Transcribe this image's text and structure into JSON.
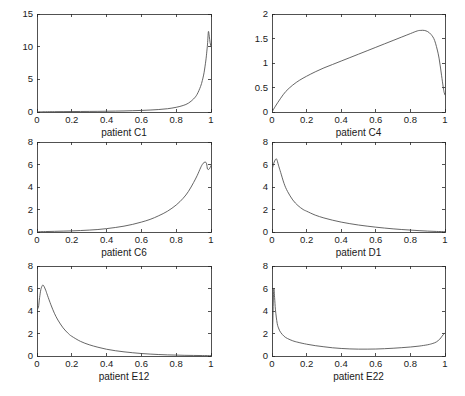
{
  "figure": {
    "background": "#ffffff",
    "curve_color": "#4a4a4a",
    "axis_color": "#262626",
    "rows": 3,
    "cols": 2
  },
  "chart_data": [
    {
      "type": "line",
      "title": "",
      "xlabel": "patient C1",
      "ylabel": "",
      "xlim": [
        0,
        1
      ],
      "ylim": [
        0,
        15
      ],
      "xticks": [
        0,
        0.2,
        0.4,
        0.6,
        0.8,
        1
      ],
      "yticks": [
        0,
        5,
        10,
        15
      ],
      "xticklabels": [
        "0",
        "0.2",
        "0.4",
        "0.6",
        "0.8",
        "1"
      ],
      "yticklabels": [
        "0",
        "5",
        "10",
        "15"
      ],
      "grid": false,
      "legend": "none",
      "x": [
        0,
        0.02,
        0.05,
        0.1,
        0.15,
        0.2,
        0.25,
        0.3,
        0.35,
        0.4,
        0.45,
        0.5,
        0.55,
        0.6,
        0.65,
        0.7,
        0.75,
        0.8,
        0.84,
        0.87,
        0.9,
        0.92,
        0.94,
        0.95,
        0.96,
        0.97,
        0.975,
        0.98,
        0.985,
        0.99,
        0.995,
        1
      ],
      "y": [
        0.02,
        0.03,
        0.04,
        0.05,
        0.06,
        0.07,
        0.08,
        0.09,
        0.1,
        0.12,
        0.14,
        0.16,
        0.2,
        0.24,
        0.3,
        0.38,
        0.5,
        0.72,
        1.0,
        1.35,
        2.0,
        2.7,
        3.9,
        4.8,
        6.0,
        7.8,
        9.0,
        10.4,
        12.3,
        11.6,
        10.6,
        10.0
      ]
    },
    {
      "type": "line",
      "title": "",
      "xlabel": "patient C4",
      "ylabel": "",
      "xlim": [
        0,
        1
      ],
      "ylim": [
        0,
        2
      ],
      "xticks": [
        0,
        0.2,
        0.4,
        0.6,
        0.8,
        1
      ],
      "yticks": [
        0,
        0.5,
        1,
        1.5,
        2
      ],
      "xticklabels": [
        "0",
        "0.2",
        "0.4",
        "0.6",
        "0.8",
        "1"
      ],
      "yticklabels": [
        "0",
        "0.5",
        "1",
        "1.5",
        "2"
      ],
      "grid": false,
      "legend": "none",
      "x": [
        0,
        0.02,
        0.05,
        0.08,
        0.12,
        0.16,
        0.2,
        0.25,
        0.3,
        0.35,
        0.4,
        0.45,
        0.5,
        0.55,
        0.6,
        0.65,
        0.7,
        0.75,
        0.8,
        0.84,
        0.86,
        0.88,
        0.9,
        0.92,
        0.94,
        0.96,
        0.97,
        0.98,
        0.99,
        0.995,
        1
      ],
      "y": [
        0.0,
        0.12,
        0.28,
        0.42,
        0.55,
        0.65,
        0.73,
        0.82,
        0.9,
        0.97,
        1.04,
        1.11,
        1.18,
        1.25,
        1.32,
        1.39,
        1.46,
        1.53,
        1.6,
        1.655,
        1.665,
        1.665,
        1.64,
        1.58,
        1.46,
        1.2,
        1.0,
        0.75,
        0.5,
        0.4,
        0.35
      ]
    },
    {
      "type": "line",
      "title": "",
      "xlabel": "patient C6",
      "ylabel": "",
      "xlim": [
        0,
        1
      ],
      "ylim": [
        0,
        8
      ],
      "xticks": [
        0,
        0.2,
        0.4,
        0.6,
        0.8,
        1
      ],
      "yticks": [
        0,
        2,
        4,
        6,
        8
      ],
      "xticklabels": [
        "0",
        "0.2",
        "0.4",
        "0.6",
        "0.8",
        "1"
      ],
      "yticklabels": [
        "0",
        "2",
        "4",
        "6",
        "8"
      ],
      "grid": false,
      "legend": "none",
      "x": [
        0,
        0.05,
        0.1,
        0.15,
        0.2,
        0.25,
        0.3,
        0.35,
        0.4,
        0.45,
        0.5,
        0.55,
        0.6,
        0.65,
        0.7,
        0.75,
        0.8,
        0.84,
        0.87,
        0.9,
        0.92,
        0.94,
        0.95,
        0.96,
        0.97,
        0.975,
        0.98,
        0.99,
        1
      ],
      "y": [
        0.02,
        0.04,
        0.06,
        0.08,
        0.1,
        0.13,
        0.17,
        0.22,
        0.3,
        0.4,
        0.52,
        0.68,
        0.88,
        1.12,
        1.45,
        1.85,
        2.4,
        3.0,
        3.6,
        4.4,
        5.0,
        5.7,
        6.0,
        6.18,
        6.2,
        6.05,
        5.6,
        5.6,
        5.9
      ]
    },
    {
      "type": "line",
      "title": "",
      "xlabel": "patient D1",
      "ylabel": "",
      "xlim": [
        0,
        1
      ],
      "ylim": [
        0,
        8
      ],
      "xticks": [
        0,
        0.2,
        0.4,
        0.6,
        0.8,
        1
      ],
      "yticks": [
        0,
        2,
        4,
        6,
        8
      ],
      "xticklabels": [
        "0",
        "0.2",
        "0.4",
        "0.6",
        "0.8",
        "1"
      ],
      "yticklabels": [
        "0",
        "2",
        "4",
        "6",
        "8"
      ],
      "grid": false,
      "legend": "none",
      "x": [
        0,
        0.01,
        0.02,
        0.025,
        0.03,
        0.04,
        0.05,
        0.07,
        0.09,
        0.12,
        0.15,
        0.18,
        0.2,
        0.25,
        0.3,
        0.35,
        0.4,
        0.45,
        0.5,
        0.55,
        0.6,
        0.65,
        0.7,
        0.75,
        0.8,
        0.85,
        0.9,
        0.95,
        1
      ],
      "y": [
        5.5,
        6.1,
        6.45,
        6.5,
        6.35,
        5.8,
        5.3,
        4.3,
        3.6,
        2.85,
        2.35,
        2.0,
        1.85,
        1.5,
        1.25,
        1.05,
        0.88,
        0.74,
        0.62,
        0.52,
        0.43,
        0.35,
        0.28,
        0.22,
        0.17,
        0.12,
        0.08,
        0.05,
        0.03
      ]
    },
    {
      "type": "line",
      "title": "",
      "xlabel": "patient E12",
      "ylabel": "",
      "xlim": [
        0,
        1
      ],
      "ylim": [
        0,
        8
      ],
      "xticks": [
        0,
        0.2,
        0.4,
        0.6,
        0.8,
        1
      ],
      "yticks": [
        0,
        2,
        4,
        6,
        8
      ],
      "xticklabels": [
        "0",
        "0.2",
        "0.4",
        "0.6",
        "0.8",
        "1"
      ],
      "yticklabels": [
        "0",
        "2",
        "4",
        "6",
        "8"
      ],
      "grid": false,
      "legend": "none",
      "x": [
        0,
        0.008,
        0.015,
        0.022,
        0.03,
        0.035,
        0.04,
        0.05,
        0.06,
        0.08,
        0.1,
        0.12,
        0.15,
        0.18,
        0.2,
        0.25,
        0.3,
        0.35,
        0.4,
        0.45,
        0.5,
        0.55,
        0.6,
        0.65,
        0.7,
        0.75,
        0.8,
        0.85,
        0.9,
        0.95,
        1
      ],
      "y": [
        4.2,
        4.3,
        5.2,
        5.9,
        6.25,
        6.3,
        6.2,
        5.85,
        5.4,
        4.55,
        3.8,
        3.2,
        2.5,
        2.0,
        1.75,
        1.3,
        1.0,
        0.78,
        0.6,
        0.47,
        0.37,
        0.29,
        0.22,
        0.17,
        0.13,
        0.1,
        0.08,
        0.06,
        0.05,
        0.04,
        0.03
      ]
    },
    {
      "type": "line",
      "title": "",
      "xlabel": "patient E22",
      "ylabel": "",
      "xlim": [
        0,
        1
      ],
      "ylim": [
        0,
        8
      ],
      "xticks": [
        0,
        0.2,
        0.4,
        0.6,
        0.8,
        1
      ],
      "yticks": [
        0,
        2,
        4,
        6,
        8
      ],
      "xticklabels": [
        "0",
        "0.2",
        "0.4",
        "0.6",
        "0.8",
        "1"
      ],
      "yticklabels": [
        "0",
        "2",
        "4",
        "6",
        "8"
      ],
      "grid": false,
      "legend": "none",
      "x": [
        0,
        0.005,
        0.01,
        0.015,
        0.02,
        0.03,
        0.04,
        0.05,
        0.07,
        0.09,
        0.12,
        0.15,
        0.2,
        0.25,
        0.3,
        0.35,
        0.4,
        0.45,
        0.5,
        0.55,
        0.6,
        0.65,
        0.7,
        0.75,
        0.8,
        0.85,
        0.9,
        0.93,
        0.95,
        0.97,
        0.98,
        0.99,
        1
      ],
      "y": [
        0.0,
        3.2,
        5.9,
        5.2,
        4.1,
        2.9,
        2.4,
        2.1,
        1.75,
        1.55,
        1.35,
        1.22,
        1.05,
        0.92,
        0.82,
        0.73,
        0.67,
        0.63,
        0.61,
        0.61,
        0.62,
        0.65,
        0.69,
        0.74,
        0.8,
        0.88,
        1.0,
        1.12,
        1.25,
        1.5,
        1.7,
        1.9,
        2.05
      ]
    }
  ],
  "panels": [
    {
      "id": "c1",
      "xlabel": "patient C1"
    },
    {
      "id": "c4",
      "xlabel": "patient C4"
    },
    {
      "id": "c6",
      "xlabel": "patient C6"
    },
    {
      "id": "d1",
      "xlabel": "patient D1"
    },
    {
      "id": "e12",
      "xlabel": "patient E12"
    },
    {
      "id": "e22",
      "xlabel": "patient E22"
    }
  ]
}
